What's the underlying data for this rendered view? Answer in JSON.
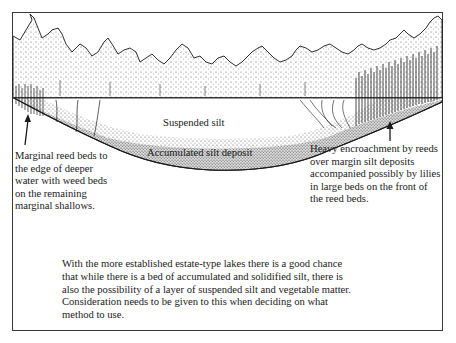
{
  "diagram": {
    "type": "lake cross-section illustration",
    "labels": {
      "suspended_silt": "Suspended silt",
      "accumulated_silt": "Accumulated silt deposit"
    },
    "annotations": {
      "left": {
        "lines": [
          "Marginal reed beds to",
          "the edge of deeper",
          "water with weed beds",
          "on the remaining",
          "marginal shallows."
        ]
      },
      "right": {
        "lines": [
          "Heavy encroachment by reeds",
          "over margin silt deposits",
          "accompanied possibly by lilies",
          "in large beds on the front of",
          "the reed beds."
        ]
      }
    },
    "caption": {
      "lines": [
        "With the more established estate-type lakes there is a good chance",
        "that while there is a bed of accumulated and solidified silt, there is",
        "also the possibility of a layer of suspended silt and vegetable matter.",
        "Consideration needs to be given to this when deciding on what",
        "method to use."
      ]
    },
    "colors": {
      "ink": "#1a1a1a",
      "paper": "#ffffff",
      "stipple": "#9a9a9a"
    }
  }
}
